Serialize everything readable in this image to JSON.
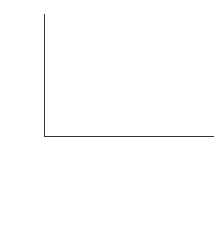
{
  "chart_data": {
    "type": "bar",
    "stacked": true,
    "title": "",
    "xlabel": "",
    "ylabel": "Number of deaths (%)",
    "ylim": [
      0,
      100
    ],
    "yticks": [
      0,
      20,
      40,
      60,
      80,
      100
    ],
    "grid": false,
    "categories": [
      "1985–87",
      "1988–90",
      "1991–93"
    ],
    "totals": [
      139,
      145,
      129
    ],
    "segment_heights_note": "Segment heights (values) are percentages estimated from pixel positions against the y-axis, accurate to roughly ±1–2%. They are not derived from the printed labels. The printed in-bar numbers are recorded separately in 'printed_labels'.",
    "series": [
      {
        "name": "Thrombotic events",
        "color": "#a4a4a4",
        "values": [
          25,
          29,
          31
        ],
        "printed_labels": [
          "35",
          "42",
          "40"
        ]
      },
      {
        "name": "Hypertensive disorders",
        "color": "#c8c8c8",
        "values": [
          14,
          10,
          10
        ],
        "printed_labels": [
          "27",
          "27",
          "20"
        ]
      },
      {
        "name": "Anaesthesia",
        "color": "#ececec",
        "values": [
          9,
          7,
          9
        ],
        "printed_labels": [
          "",
          "",
          ""
        ]
      },
      {
        "name": "Obstetrical causes",
        "color": "#ffffff",
        "values": [
          52,
          54,
          50
        ],
        "printed_labels": [
          "",
          "",
          ""
        ]
      }
    ],
    "legend": {
      "position": "bottom",
      "entries": [
        "Obstetrical causes",
        "Anaesthesia",
        "Hypertensive disorders",
        "Thrombotic events"
      ]
    }
  },
  "labels": {
    "ylabel": "Number of deaths (%)",
    "yticks": [
      "100",
      "80",
      "60",
      "40",
      "20",
      "0"
    ],
    "total_word1": "Total",
    "total_word2": "deaths",
    "bars": [
      {
        "category": "1985–87",
        "total": "139",
        "thrombotic": "35",
        "hypertensive": "27"
      },
      {
        "category": "1988–90",
        "total": "145",
        "thrombotic": "42",
        "hypertensive": "27"
      },
      {
        "category": "1991–93",
        "total": "129",
        "thrombotic": "40",
        "hypertensive": "20"
      }
    ],
    "legend": [
      "Obstetrical causes",
      "Anaesthesia",
      "Hypertensive disorders",
      "Thrombotic events"
    ]
  }
}
